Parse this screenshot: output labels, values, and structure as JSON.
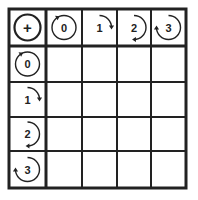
{
  "table": {
    "corner_symbol": "+",
    "column_headers": [
      {
        "label": "0",
        "icon": "full-circle-arrow-icon"
      },
      {
        "label": "1",
        "icon": "quarter-turn-arrow-icon"
      },
      {
        "label": "2",
        "icon": "half-turn-arrow-icon"
      },
      {
        "label": "3",
        "icon": "three-quarter-turn-arrow-icon"
      }
    ],
    "row_headers": [
      {
        "label": "0",
        "icon": "full-circle-arrow-icon"
      },
      {
        "label": "1",
        "icon": "quarter-turn-arrow-icon"
      },
      {
        "label": "2",
        "icon": "half-turn-arrow-icon"
      },
      {
        "label": "3",
        "icon": "three-quarter-turn-arrow-icon"
      }
    ],
    "cells": [
      [
        "",
        "",
        "",
        ""
      ],
      [
        "",
        "",
        "",
        ""
      ],
      [
        "",
        "",
        "",
        ""
      ],
      [
        "",
        "",
        "",
        ""
      ]
    ],
    "colors": {
      "line": "#222222",
      "background": "#ffffff"
    }
  }
}
